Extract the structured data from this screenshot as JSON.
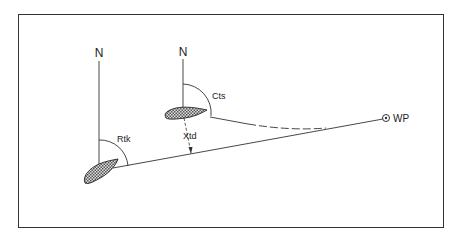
{
  "diagram": {
    "north_left": "N",
    "north_right": "N",
    "label_rtk": "Rtk",
    "label_cts": "Cts",
    "label_xtd": "Xtd",
    "label_wp": "WP"
  },
  "colors": {
    "line": "#333333",
    "boat_fill": "#9a9a9a",
    "background": "#ffffff"
  }
}
